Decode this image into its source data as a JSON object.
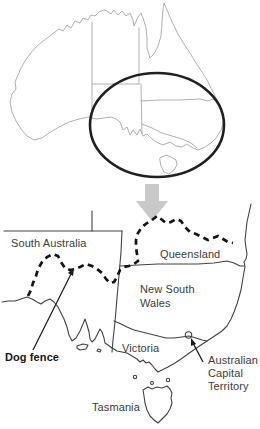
{
  "figure": {
    "type": "map",
    "overview_map": {
      "description": "Australia outline with state borders, ellipse highlighting the south-east",
      "zoom_indicator": "downward block arrow"
    },
    "labels": {
      "south_australia": "South Australia",
      "queensland": "Queensland",
      "new_south_wales_line1": "New South",
      "new_south_wales_line2": "Wales",
      "victoria": "Victoria",
      "tasmania": "Tasmania",
      "dog_fence": "Dog fence",
      "act_line1": "Australian",
      "act_line2": "Capital",
      "act_line3": "Territory"
    },
    "colors": {
      "outline_light": "#b0b0b0",
      "outline_dark": "#424242",
      "fence": "#141414",
      "ellipse": "#202020",
      "arrow_fill": "#c9c9c9",
      "arrow_stroke": "#8c8c8c",
      "annotation": "#1a1a1a",
      "text": "#3c3c3c"
    }
  }
}
